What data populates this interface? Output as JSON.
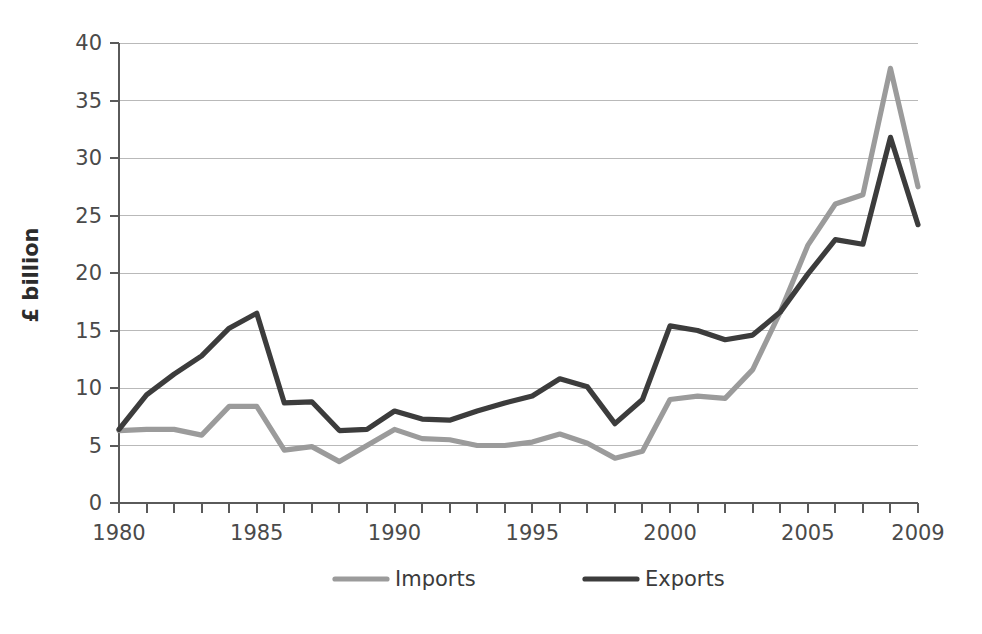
{
  "chart_data": {
    "type": "line",
    "title": "",
    "xlabel": "",
    "ylabel": "£ billion",
    "ylim": [
      0,
      40
    ],
    "xlim": [
      1980,
      2009
    ],
    "ytick_step": 5,
    "yticks": [
      "0",
      "5",
      "10",
      "15",
      "20",
      "25",
      "30",
      "35",
      "40"
    ],
    "xticks_labeled": [
      "1980",
      "1985",
      "1990",
      "1995",
      "2000",
      "2005",
      "2009"
    ],
    "grid": "horizontal",
    "legend_position": "bottom-center",
    "x": [
      1980,
      1981,
      1982,
      1983,
      1984,
      1985,
      1986,
      1987,
      1988,
      1989,
      1990,
      1991,
      1992,
      1993,
      1994,
      1995,
      1996,
      1997,
      1998,
      1999,
      2000,
      2001,
      2002,
      2003,
      2004,
      2005,
      2006,
      2007,
      2008,
      2009
    ],
    "series": [
      {
        "name": "Imports",
        "color": "#9b9b9b",
        "values": [
          6.3,
          6.4,
          6.4,
          5.9,
          8.4,
          8.4,
          4.6,
          4.9,
          3.6,
          5.0,
          6.4,
          5.6,
          5.5,
          5.0,
          5.0,
          5.3,
          6.0,
          5.2,
          3.9,
          4.5,
          9.0,
          9.3,
          9.1,
          11.6,
          16.6,
          22.4,
          26.0,
          26.8,
          37.8,
          27.5
        ]
      },
      {
        "name": "Exports",
        "color": "#3c3c3c",
        "values": [
          6.4,
          9.4,
          11.2,
          12.8,
          15.2,
          16.5,
          8.7,
          8.8,
          6.3,
          6.4,
          8.0,
          7.3,
          7.2,
          8.0,
          8.7,
          9.3,
          10.8,
          10.1,
          6.9,
          9.0,
          15.4,
          15.0,
          14.2,
          14.6,
          16.6,
          19.9,
          22.9,
          22.5,
          31.8,
          24.2
        ]
      }
    ],
    "legend": [
      {
        "label": "Imports",
        "color": "#9b9b9b"
      },
      {
        "label": "Exports",
        "color": "#3c3c3c"
      }
    ]
  }
}
